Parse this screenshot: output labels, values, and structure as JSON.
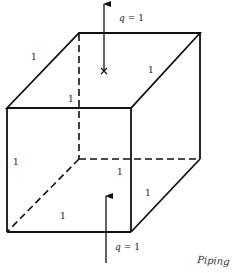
{
  "diagram": {
    "type": "unit-cube-flux",
    "edge_labels": [
      "1",
      "1",
      "1",
      "1",
      "1",
      "1",
      "1"
    ],
    "flux_top": {
      "symbol": "q",
      "eq": "= 1"
    },
    "flux_bottom": {
      "symbol": "q",
      "eq": "= 1"
    },
    "handwritten_note": "Piping",
    "colors": {
      "line": "#111111",
      "background": "#ffffff"
    }
  }
}
